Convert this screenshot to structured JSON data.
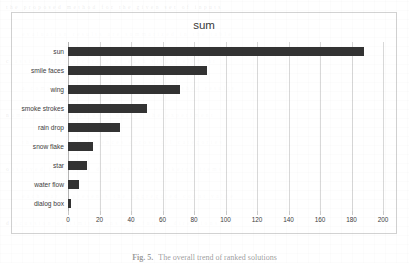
{
  "chart_data": {
    "type": "bar",
    "orientation": "horizontal",
    "title": "sum",
    "xlabel": "",
    "ylabel": "",
    "categories": [
      "sun",
      "smile faces",
      "wing",
      "smoke strokes",
      "rain drop",
      "snow flake",
      "star",
      "water flow",
      "dialog box"
    ],
    "values": [
      188,
      88,
      71,
      50,
      33,
      16,
      12,
      7,
      2
    ],
    "xlim": [
      0,
      200
    ],
    "xticks": [
      0,
      20,
      40,
      60,
      80,
      100,
      120,
      140,
      160,
      180,
      200
    ],
    "xtick_labels": [
      "0",
      "20",
      "40",
      "60",
      "80",
      "100",
      "120",
      "140",
      "160",
      "180",
      "200"
    ],
    "grid": "vertical",
    "legend": null,
    "bar_color": "#333333",
    "gridline_color": "#d8d8d8",
    "frame_color": "#d2d2d2"
  },
  "caption": {
    "label": "Fig. 5.",
    "text": "The overall trend of ranked solutions"
  },
  "background_text": {
    "rows": [
      "the proposed method for the given set of inputs",
      "evaluation results are summarized in the table",
      "classification accuracy of each visual element",
      "a comparison with previously published results",
      "number of samples used during the experiment",
      "the sum of occurrences across all categories",
      "observed frequency distribution of sketch items",
      "each bar represents the aggregated count value",
      "discussion of limitations and future directions"
    ]
  }
}
